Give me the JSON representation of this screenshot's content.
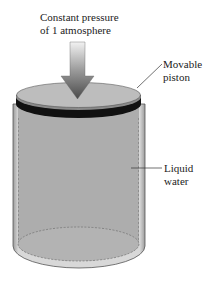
{
  "diagram": {
    "type": "piston-cylinder",
    "labels": {
      "pressure_line1": "Constant pressure",
      "pressure_line2": "of 1 atmosphere",
      "piston_line1": "Movable",
      "piston_line2": "piston",
      "liquid_line1": "Liquid",
      "liquid_line2": "water"
    },
    "components": [
      "pressure-arrow",
      "movable-piston",
      "cylinder",
      "liquid-water"
    ],
    "colors": {
      "piston_top": "#b9b9b9",
      "piston_band": "#111111",
      "liquid": "#adadad",
      "cylinder_wall": "#d6d6d6",
      "arrow_top": "#e8e8e8",
      "arrow_bottom": "#555555",
      "leader_line": "#333333"
    }
  }
}
